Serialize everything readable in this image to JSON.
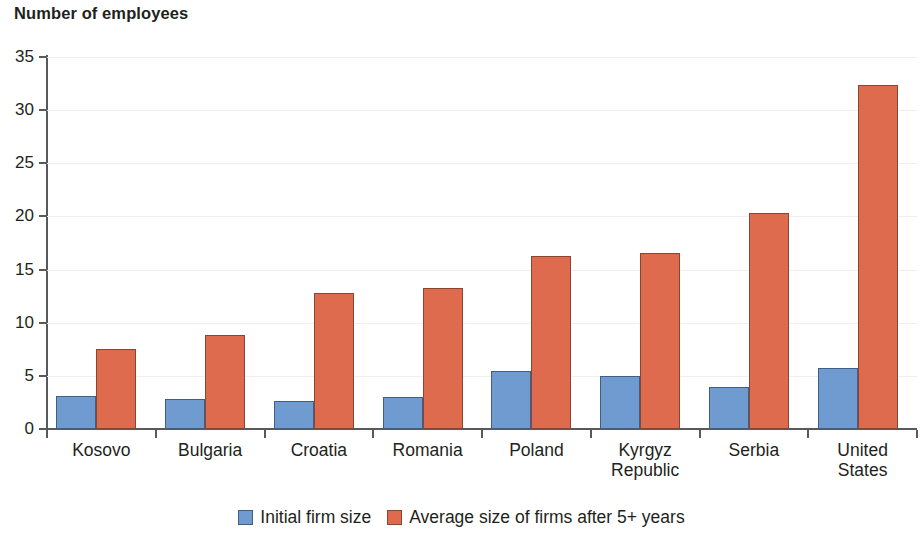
{
  "chart_data": {
    "type": "bar",
    "title": "Number of employees",
    "subtitle": "",
    "xlabel": "",
    "ylabel": "",
    "ylim": [
      0,
      35
    ],
    "yticks": [
      0,
      5,
      10,
      15,
      20,
      25,
      30,
      35
    ],
    "ytick_labels": [
      "0",
      "5",
      "10",
      "15",
      "20",
      "25",
      "30",
      "35"
    ],
    "grid": true,
    "legend_position": "bottom",
    "categories": [
      "Kosovo",
      "Bulgaria",
      "Croatia",
      "Romania",
      "Poland",
      "Kyrgyz\nRepublic",
      "Serbia",
      "United\nStates"
    ],
    "series": [
      {
        "name": "Initial firm size",
        "color": "#6f9bd1",
        "values": [
          3.1,
          2.8,
          2.6,
          3.0,
          5.5,
          5.0,
          4.0,
          5.7
        ]
      },
      {
        "name": "Average size of firms after 5+ years",
        "color": "#df6b4f",
        "values": [
          7.5,
          8.8,
          12.8,
          13.3,
          16.3,
          16.6,
          20.3,
          32.4
        ]
      }
    ]
  },
  "legend": {
    "items": [
      {
        "label": "Initial firm size",
        "swatch": "series-initial-swatch"
      },
      {
        "label": "Average size of firms after 5+ years",
        "swatch": "series-after-swatch"
      }
    ]
  }
}
